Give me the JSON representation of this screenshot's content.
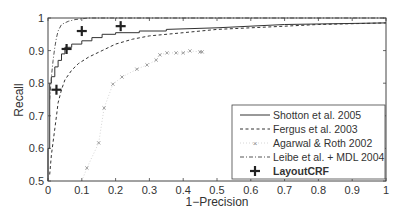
{
  "chart_data": {
    "type": "line",
    "title": "",
    "xlabel": "1−Precision",
    "ylabel": "Recall",
    "xlim": [
      0,
      1
    ],
    "ylim": [
      0.5,
      1
    ],
    "grid": false,
    "legend_position": "lower right",
    "x_ticks": [
      "0",
      "0.1",
      "0.2",
      "0.3",
      "0.4",
      "0.5",
      "0.6",
      "0.7",
      "0.8",
      "0.9",
      "1"
    ],
    "y_ticks": [
      "0.5",
      "0.6",
      "0.7",
      "0.8",
      "0.9",
      "1"
    ],
    "series": [
      {
        "name": "Shotton et al. 2005",
        "style": "solid",
        "color": "#333333",
        "x": [
          0.0,
          0.0,
          0.005,
          0.005,
          0.01,
          0.01,
          0.02,
          0.02,
          0.03,
          0.03,
          0.04,
          0.04,
          0.05,
          0.05,
          0.07,
          0.07,
          0.1,
          0.1,
          0.13,
          0.13,
          0.16,
          0.16,
          0.2,
          0.2,
          0.27,
          0.27,
          0.35,
          0.35,
          0.5,
          0.7,
          1.0
        ],
        "y": [
          0.5,
          0.6,
          0.6,
          0.8,
          0.8,
          0.82,
          0.82,
          0.85,
          0.85,
          0.87,
          0.87,
          0.89,
          0.89,
          0.91,
          0.91,
          0.92,
          0.92,
          0.93,
          0.93,
          0.94,
          0.94,
          0.95,
          0.95,
          0.955,
          0.955,
          0.96,
          0.96,
          0.965,
          0.97,
          0.98,
          0.985
        ]
      },
      {
        "name": "Fergus et al. 2003",
        "style": "dashed",
        "color": "#333333",
        "x": [
          0.005,
          0.01,
          0.015,
          0.02,
          0.025,
          0.03,
          0.04,
          0.05,
          0.07,
          0.09,
          0.12,
          0.16,
          0.2,
          0.25,
          0.3,
          0.4,
          0.5,
          0.6,
          0.7,
          0.8,
          1.0
        ],
        "y": [
          0.52,
          0.58,
          0.62,
          0.66,
          0.7,
          0.74,
          0.78,
          0.81,
          0.84,
          0.86,
          0.88,
          0.9,
          0.92,
          0.935,
          0.945,
          0.955,
          0.965,
          0.97,
          0.975,
          0.98,
          0.985
        ]
      },
      {
        "name": "Agarwal & Roth 2002",
        "style": "dotted-x",
        "color": "#999999",
        "x": [
          0.1,
          0.115,
          0.15,
          0.166,
          0.192,
          0.219,
          0.263,
          0.293,
          0.32,
          0.331,
          0.352,
          0.379,
          0.4,
          0.42,
          0.45,
          0.456
        ],
        "y": [
          0.5,
          0.54,
          0.617,
          0.724,
          0.797,
          0.819,
          0.843,
          0.856,
          0.871,
          0.887,
          0.893,
          0.893,
          0.893,
          0.899,
          0.896,
          0.896
        ]
      },
      {
        "name": "Leibe et al. + MDL 2004",
        "style": "dash-dot",
        "color": "#555555",
        "x": [
          0.005,
          0.01,
          0.015,
          0.02,
          0.025,
          0.03,
          0.04,
          0.06,
          0.08,
          0.12,
          1.0
        ],
        "y": [
          0.75,
          0.82,
          0.87,
          0.91,
          0.94,
          0.96,
          0.98,
          0.99,
          0.995,
          1.0,
          1.0
        ]
      },
      {
        "name": "LayoutCRF",
        "style": "markers-plus",
        "color": "#222222",
        "x": [
          0.025,
          0.055,
          0.1,
          0.215
        ],
        "y": [
          0.78,
          0.905,
          0.96,
          0.975
        ]
      }
    ]
  },
  "axes": {
    "xlabel": "1−Precision",
    "ylabel": "Recall",
    "x_ticks": [
      "0",
      "0.1",
      "0.2",
      "0.3",
      "0.4",
      "0.5",
      "0.6",
      "0.7",
      "0.8",
      "0.9",
      "1"
    ],
    "y_ticks": [
      "0.5",
      "0.6",
      "0.7",
      "0.8",
      "0.9",
      "1"
    ]
  },
  "legend": {
    "items": [
      {
        "label": "Shotton et al. 2005"
      },
      {
        "label": "Fergus et al. 2003"
      },
      {
        "label": "Agarwal & Roth 2002"
      },
      {
        "label": "Leibe et al. + MDL 2004"
      },
      {
        "label": "LayoutCRF"
      }
    ]
  }
}
